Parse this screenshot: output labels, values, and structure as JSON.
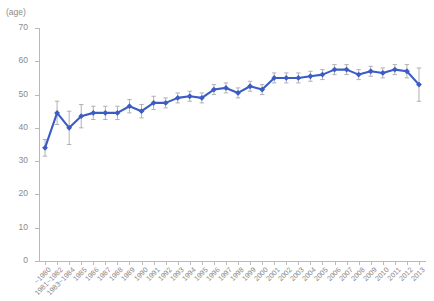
{
  "chart_data": {
    "type": "line",
    "title": "",
    "subtitle": "",
    "xlabel": "",
    "ylabel": "",
    "y_unit_label": "(age)",
    "ylim": [
      0,
      70
    ],
    "y_ticks": [
      0,
      10,
      20,
      30,
      40,
      50,
      60,
      70
    ],
    "grid": false,
    "legend": "none",
    "series_color": "#3b5cc4",
    "errorbar_color": "#a9a9a9",
    "axis_color": "#b9b9b9",
    "tick_text_color": "#8a8a8a",
    "marker": "diamond",
    "has_error_bars": true,
    "categories": [
      "~1980",
      "1981~1982",
      "1983~1984",
      "1985",
      "1986",
      "1987",
      "1988",
      "1989",
      "1990",
      "1991",
      "1992",
      "1993",
      "1994",
      "1995",
      "1996",
      "1997",
      "1998",
      "1999",
      "2000",
      "2001",
      "2002",
      "2003",
      "2004",
      "2005",
      "2006",
      "2007",
      "2008",
      "2009",
      "2010",
      "2011",
      "2012",
      "2013"
    ],
    "values": [
      34.0,
      44.5,
      40.0,
      43.5,
      44.5,
      44.5,
      44.5,
      46.5,
      45.0,
      47.5,
      47.5,
      49.0,
      49.5,
      49.0,
      51.5,
      52.0,
      50.5,
      52.5,
      51.5,
      55.0,
      55.0,
      55.0,
      55.5,
      56.0,
      57.5,
      57.5,
      56.0,
      57.0,
      56.5,
      57.5,
      57.0,
      53.0
    ],
    "err_upper": [
      36.5,
      48.0,
      45.0,
      47.0,
      46.5,
      46.5,
      46.5,
      48.5,
      47.0,
      49.5,
      49.0,
      50.5,
      51.0,
      50.5,
      53.0,
      53.5,
      52.0,
      54.0,
      53.0,
      56.5,
      56.5,
      56.5,
      57.0,
      57.5,
      59.0,
      59.0,
      57.5,
      58.5,
      58.0,
      59.0,
      59.0,
      58.0
    ],
    "err_lower": [
      31.5,
      41.0,
      35.0,
      40.0,
      42.5,
      42.5,
      42.5,
      44.5,
      43.0,
      45.5,
      46.0,
      47.5,
      48.0,
      47.5,
      50.0,
      50.5,
      49.0,
      51.0,
      50.0,
      53.5,
      53.5,
      53.5,
      54.0,
      54.5,
      56.0,
      56.0,
      54.5,
      55.5,
      55.0,
      56.0,
      55.0,
      48.0
    ]
  }
}
